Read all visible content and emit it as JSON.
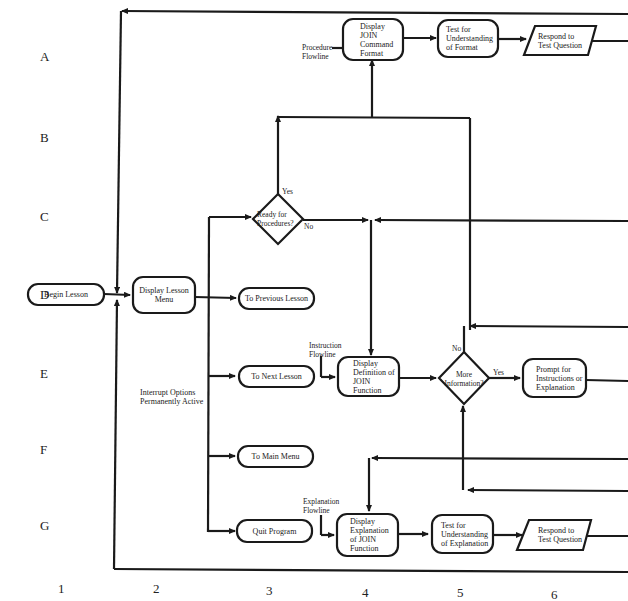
{
  "grid": {
    "rows": [
      "A",
      "B",
      "C",
      "D",
      "E",
      "F",
      "G"
    ],
    "columns": [
      "1",
      "2",
      "3",
      "4",
      "5",
      "6"
    ]
  },
  "nodes": {
    "begin_lesson": "Begin Lesson",
    "display_lesson_menu": "Display Lesson Menu",
    "to_previous_lesson": "To Previous Lesson",
    "to_next_lesson": "To Next Lesson",
    "to_main_menu": "To Main Menu",
    "quit_program": "Quit Program",
    "ready_for_procedures": "Ready for Procedures?",
    "display_join_command_format": "Display JOIN Command Format",
    "test_understanding_format": "Test for Understanding of Format",
    "respond_test_question_top": "Respond to Test Question",
    "display_definition_join": "Display Definition of JOIN Function",
    "more_information": "More Information?",
    "prompt_instructions": "Prompt for Instructions or Explanation",
    "display_explanation_join": "Display Explanation of JOIN Function",
    "test_understanding_explanation": "Test for Understanding of Explanation",
    "respond_test_question_bottom": "Respond to Test Question"
  },
  "annotations": {
    "procedure_flowline": "Procedure Flowline",
    "instruction_flowline": "Instruction Flowline",
    "explanation_flowline": "Explanation Flowline",
    "interrupt_options": "Interrupt Options Permanently Active",
    "ready_yes": "Yes",
    "ready_no": "No",
    "more_yes": "Yes",
    "more_no": "No"
  },
  "colors": {
    "line": "#1a1a1a",
    "background": "#ffffff"
  }
}
